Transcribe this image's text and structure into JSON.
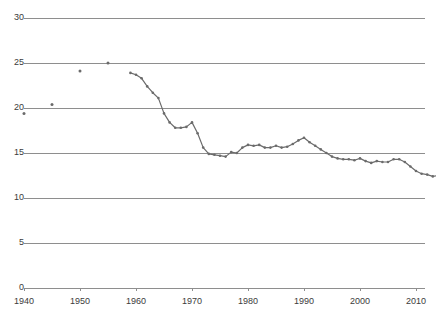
{
  "chart_data": {
    "type": "line",
    "title": "",
    "subtitle": "",
    "xlabel": "",
    "ylabel": "",
    "xlim": [
      1938,
      2017
    ],
    "ylim": [
      0,
      30
    ],
    "grid": true,
    "grid_orientation": "horizontal",
    "legend": false,
    "legend_position": "none",
    "y_ticks": [
      0,
      5,
      10,
      15,
      20,
      25,
      30
    ],
    "y_tick_labels": [
      "0",
      "5",
      "10",
      "15",
      "20",
      "25",
      "30"
    ],
    "x_ticks": [
      1940,
      1950,
      1960,
      1970,
      1980,
      1990,
      2000,
      2010
    ],
    "x_tick_labels": [
      "1940",
      "1950",
      "1960",
      "1970",
      "1980",
      "1990",
      "2000",
      "2010"
    ],
    "series": [
      {
        "name": "early-sparse-points",
        "style": "markers-only",
        "color": "#6b6b6b",
        "x": [
          1940,
          1945,
          1950,
          1955
        ],
        "values": [
          19.4,
          20.4,
          24.1,
          25.0
        ]
      },
      {
        "name": "annual-series",
        "style": "line-with-markers",
        "color": "#6b6b6b",
        "x": [
          1959,
          1960,
          1961,
          1962,
          1963,
          1964,
          1965,
          1966,
          1967,
          1968,
          1969,
          1970,
          1971,
          1972,
          1973,
          1974,
          1975,
          1976,
          1977,
          1978,
          1979,
          1980,
          1981,
          1982,
          1983,
          1984,
          1985,
          1986,
          1987,
          1988,
          1989,
          1990,
          1991,
          1992,
          1993,
          1994,
          1995,
          1996,
          1997,
          1998,
          1999,
          2000,
          2001,
          2002,
          2003,
          2004,
          2005,
          2006,
          2007,
          2008,
          2009,
          2010,
          2011,
          2012,
          2013,
          2014,
          2015
        ],
        "values": [
          23.9,
          23.7,
          23.3,
          22.4,
          21.7,
          21.1,
          19.4,
          18.4,
          17.8,
          17.8,
          17.9,
          18.4,
          17.2,
          15.6,
          14.9,
          14.8,
          14.7,
          14.6,
          15.1,
          15.0,
          15.6,
          15.9,
          15.8,
          15.9,
          15.6,
          15.6,
          15.8,
          15.6,
          15.7,
          16.0,
          16.4,
          16.7,
          16.2,
          15.8,
          15.4,
          15.0,
          14.6,
          14.4,
          14.3,
          14.3,
          14.2,
          14.4,
          14.1,
          13.9,
          14.1,
          14.0,
          14.0,
          14.3,
          14.3,
          14.0,
          13.5,
          13.0,
          12.7,
          12.6,
          12.4,
          12.5,
          12.4
        ]
      }
    ]
  },
  "axes": {
    "y_axis_name": "y-axis",
    "x_axis_name": "x-axis"
  }
}
